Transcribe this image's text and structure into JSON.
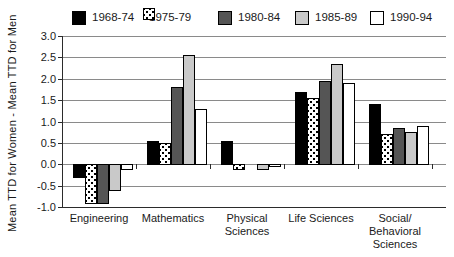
{
  "chart_data": {
    "type": "bar",
    "title": "",
    "xlabel": "",
    "ylabel": "Mean TTD for Women - Mean TTD for Men",
    "ylim": [
      -1.0,
      3.0
    ],
    "ytick_step": 0.5,
    "ytick_labels": [
      "3.0",
      "2.5",
      "2.0",
      "1.5",
      "1.0",
      "0.5",
      "0.0",
      "-0.5",
      "-1.0"
    ],
    "grid": true,
    "legend_position": "top",
    "categories": [
      "Engineering",
      "Mathematics",
      "Physical Sciences",
      "Life Sciences",
      "Social/Behavioral Sciences"
    ],
    "category_label_lines": [
      [
        "Engineering"
      ],
      [
        "Mathematics"
      ],
      [
        "Physical",
        "Sciences"
      ],
      [
        "Life Sciences"
      ],
      [
        "Social/",
        "Behavioral",
        "Sciences"
      ]
    ],
    "series": [
      {
        "name": "1968-74",
        "pattern": "solid",
        "fill": "#000000",
        "values": [
          -0.3,
          0.55,
          0.55,
          1.7,
          1.4
        ]
      },
      {
        "name": "1975-79",
        "pattern": "stipple",
        "fill": "#ffffff",
        "values": [
          -0.9,
          0.5,
          -0.1,
          1.55,
          0.7
        ]
      },
      {
        "name": "1980-84",
        "pattern": "solid",
        "fill": "#555555",
        "values": [
          -0.9,
          1.8,
          0.0,
          1.95,
          0.85
        ]
      },
      {
        "name": "1985-89",
        "pattern": "solid",
        "fill": "#c9c9c9",
        "values": [
          -0.6,
          2.55,
          -0.1,
          2.35,
          0.75
        ]
      },
      {
        "name": "1990-94",
        "pattern": "solid",
        "fill": "#ffffff",
        "values": [
          -0.1,
          1.3,
          -0.05,
          1.9,
          0.9
        ]
      }
    ],
    "colors": {
      "grid": "#8a8a8a",
      "axis": "#2b2b2b",
      "bar_border": "#000000",
      "background": "#ffffff",
      "text": "#1a1a1a"
    }
  }
}
